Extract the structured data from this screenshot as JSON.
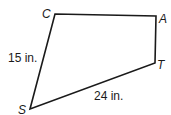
{
  "figure": {
    "shape": "quadrilateral",
    "vertices": [
      {
        "label": "C",
        "x": 55,
        "y": 14
      },
      {
        "label": "A",
        "x": 156,
        "y": 16
      },
      {
        "label": "T",
        "x": 155,
        "y": 63
      },
      {
        "label": "S",
        "x": 30,
        "y": 109
      }
    ],
    "labels": {
      "C": "C",
      "A": "A",
      "T": "T",
      "S": "S"
    },
    "measurements": {
      "CS": "15 in.",
      "ST": "24 in."
    },
    "colors": {
      "stroke": "#1a1a1a",
      "background": "#ffffff"
    }
  }
}
